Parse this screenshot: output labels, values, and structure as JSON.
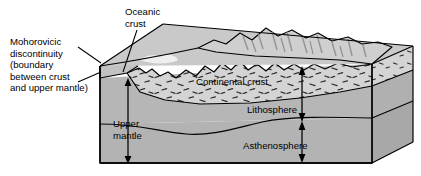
{
  "figure": {
    "type": "geological-block-diagram",
    "background_color": "#ffffff"
  },
  "labels": {
    "moho": "Mohorovicic\ndiscontinuity\n(boundary\nbetween crust\nand upper mantle)",
    "oceanic_crust": "Oceanic\ncrust",
    "continental_crust": "Continental crust",
    "upper_mantle": "Upper\nmantle",
    "lithosphere": "Lithosphere",
    "asthenosphere": "Asthenosphere"
  },
  "colors": {
    "outline": "#000000",
    "top_surface": "#c9c9c9",
    "mountain_light": "#d7d7d7",
    "mountain_shadow": "#8f8f8f",
    "crust_fill": "#d2d2d2",
    "mantle_fill": "#b0b0b0",
    "side_face": "#a2a2a2",
    "oceanic_crust_fill": "#bdbdbd",
    "text": "#000000"
  },
  "layers": [
    {
      "name": "oceanic crust",
      "position": "thin left upper slab"
    },
    {
      "name": "continental crust",
      "position": "thick central wedge with stipple texture"
    },
    {
      "name": "upper mantle",
      "position": "below crust, left side"
    },
    {
      "name": "lithosphere",
      "position": "crust plus rigid upper mantle, right side"
    },
    {
      "name": "asthenosphere",
      "position": "below lithosphere, bottom of block"
    }
  ],
  "annotations": {
    "leader_lines": [
      {
        "from": "moho label",
        "to": "crust / upper mantle boundary at left block corner"
      },
      {
        "from": "oceanic crust label",
        "to": "thin crust slab at left of block top"
      }
    ],
    "measure_arrows": [
      {
        "label": "upper mantle",
        "style": "double-headed vertical"
      },
      {
        "label": "lithosphere",
        "style": "double-headed vertical"
      },
      {
        "label": "asthenosphere",
        "style": "double-headed vertical"
      }
    ]
  }
}
